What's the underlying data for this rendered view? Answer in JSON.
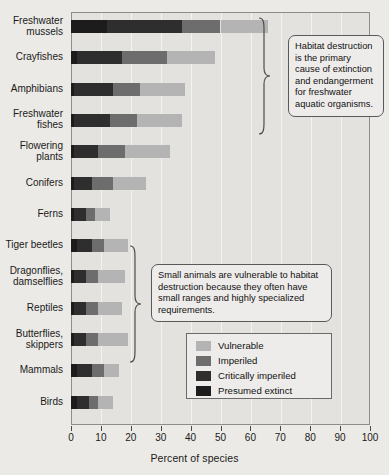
{
  "chart_data": {
    "type": "bar",
    "orientation": "horizontal",
    "stacked": true,
    "title": "",
    "xlabel": "Percent of species",
    "ylabel": "",
    "xlim": [
      0,
      100
    ],
    "xticks": [
      0,
      10,
      20,
      30,
      40,
      50,
      60,
      70,
      80,
      90,
      100
    ],
    "grid": true,
    "legend_position": "inside-lower-right",
    "categories": [
      "Freshwater mussels",
      "Crayfishes",
      "Amphibians",
      "Freshwater fishes",
      "Flowering plants",
      "Conifers",
      "Ferns",
      "Tiger beetles",
      "Dragonflies, damselflies",
      "Reptiles",
      "Butterflies, skippers",
      "Mammals",
      "Birds"
    ],
    "series": [
      {
        "name": "Presumed extinct",
        "color": "#1c1c1c",
        "values": [
          12,
          2,
          1,
          1,
          1,
          1,
          1,
          2,
          1,
          1,
          1,
          2,
          2
        ]
      },
      {
        "name": "Critically imperiled",
        "color": "#2e2e2e",
        "values": [
          25,
          15,
          13,
          12,
          8,
          6,
          4,
          5,
          4,
          4,
          4,
          5,
          4
        ]
      },
      {
        "name": "Imperiled",
        "color": "#6d6d6d",
        "values": [
          13,
          15,
          9,
          9,
          9,
          7,
          3,
          4,
          4,
          4,
          4,
          4,
          3
        ]
      },
      {
        "name": "Vulnerable",
        "color": "#b4b4b4",
        "values": [
          16,
          16,
          15,
          15,
          15,
          11,
          5,
          8,
          9,
          8,
          10,
          5,
          5
        ]
      }
    ],
    "totals": [
      66,
      48,
      38,
      37,
      33,
      25,
      13,
      19,
      18,
      17,
      19,
      16,
      14
    ]
  },
  "legend": {
    "items": [
      {
        "label": "Vulnerable",
        "color": "#b4b4b4"
      },
      {
        "label": "Imperiled",
        "color": "#6d6d6d"
      },
      {
        "label": "Critically imperiled",
        "color": "#2e2e2e"
      },
      {
        "label": "Presumed extinct",
        "color": "#1c1c1c"
      }
    ]
  },
  "annotations": [
    {
      "id": "freshwater-callout",
      "text": "Habitat destruction is the primary cause of extinction and endangerment for freshwater aquatic organisms.",
      "bracket_categories": [
        "Freshwater mussels",
        "Crayfishes",
        "Amphibians",
        "Freshwater fishes"
      ]
    },
    {
      "id": "small-animals-callout",
      "text": "Small animals are vulnerable to habitat destruction because they often have small ranges and highly specialized requirements.",
      "bracket_categories": [
        "Tiger beetles",
        "Dragonflies, damselflies",
        "Reptiles",
        "Butterflies, skippers"
      ]
    }
  ]
}
